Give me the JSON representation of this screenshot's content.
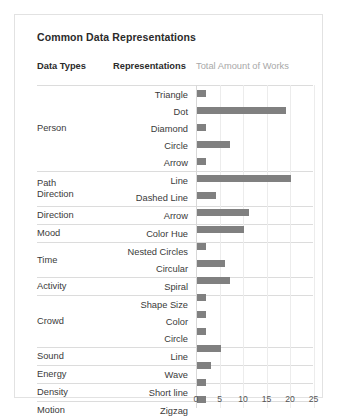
{
  "chart_title": "Common Data Representations",
  "headers": {
    "data_types": "Data Types",
    "representations": "Representations",
    "value_axis": "Total Amount of Works"
  },
  "chart_data": {
    "type": "bar",
    "orientation": "horizontal",
    "title": "Common Data Representations",
    "xlabel": "Total Amount of Works",
    "ylabel": "Representations",
    "xlim": [
      0,
      27
    ],
    "xticks": [
      0,
      5,
      10,
      15,
      20,
      25
    ],
    "xtick_labels": [
      "0",
      "5",
      "10",
      "15",
      "20",
      "25"
    ],
    "grid": "vertical",
    "legend": "none",
    "bar_color": "#808080",
    "categories": [
      "Triangle",
      "Dot",
      "Diamond",
      "Circle",
      "Arrow",
      "Line",
      "Dashed Line",
      "Arrow",
      "Color Hue",
      "Nested Circles",
      "Circular",
      "Spiral",
      "Shape Size",
      "Color",
      "Circle",
      "Line",
      "Wave",
      "Short line",
      "Zigzag"
    ],
    "values": [
      2,
      19,
      2,
      7,
      2,
      20,
      4,
      11,
      10,
      2,
      6,
      7,
      2,
      2,
      2,
      5,
      3,
      2,
      2
    ],
    "groups": [
      "Person",
      "Person",
      "Person",
      "Person",
      "Person",
      "Path Direction",
      "Path Direction",
      "Direction",
      "Mood",
      "Time",
      "Time",
      "Activity",
      "Crowd",
      "Crowd",
      "Crowd",
      "Sound",
      "Energy",
      "Density",
      "Motion"
    ]
  },
  "rows": [
    {
      "type": "Person",
      "type_line2": "",
      "rep": "Triangle",
      "value": 2,
      "sep": true,
      "group_rows": 5
    },
    {
      "type": "",
      "type_line2": "",
      "rep": "Dot",
      "value": 19,
      "sep": false,
      "group_rows": 0
    },
    {
      "type": "",
      "type_line2": "",
      "rep": "Diamond",
      "value": 2,
      "sep": false,
      "group_rows": 0
    },
    {
      "type": "",
      "type_line2": "",
      "rep": "Circle",
      "value": 7,
      "sep": false,
      "group_rows": 0
    },
    {
      "type": "",
      "type_line2": "",
      "rep": "Arrow",
      "value": 2,
      "sep": false,
      "group_rows": 0
    },
    {
      "type": "Path",
      "type_line2": "Direction",
      "rep": "Line",
      "value": 20,
      "sep": true,
      "group_rows": 2
    },
    {
      "type": "",
      "type_line2": "",
      "rep": "Dashed Line",
      "value": 4,
      "sep": false,
      "group_rows": 0
    },
    {
      "type": "Direction",
      "type_line2": "",
      "rep": "Arrow",
      "value": 11,
      "sep": true,
      "group_rows": 1
    },
    {
      "type": "Mood",
      "type_line2": "",
      "rep": "Color Hue",
      "value": 10,
      "sep": true,
      "group_rows": 1
    },
    {
      "type": "Time",
      "type_line2": "",
      "rep": "Nested Circles",
      "value": 2,
      "sep": true,
      "group_rows": 2
    },
    {
      "type": "",
      "type_line2": "",
      "rep": "Circular",
      "value": 6,
      "sep": false,
      "group_rows": 0
    },
    {
      "type": "Activity",
      "type_line2": "",
      "rep": "Spiral",
      "value": 7,
      "sep": true,
      "group_rows": 1
    },
    {
      "type": "Crowd",
      "type_line2": "",
      "rep": "Shape Size",
      "value": 2,
      "sep": true,
      "group_rows": 3
    },
    {
      "type": "",
      "type_line2": "",
      "rep": "Color",
      "value": 2,
      "sep": false,
      "group_rows": 0
    },
    {
      "type": "",
      "type_line2": "",
      "rep": "Circle",
      "value": 2,
      "sep": false,
      "group_rows": 0
    },
    {
      "type": "Sound",
      "type_line2": "",
      "rep": "Line",
      "value": 5,
      "sep": true,
      "group_rows": 1
    },
    {
      "type": "Energy",
      "type_line2": "",
      "rep": "Wave",
      "value": 3,
      "sep": true,
      "group_rows": 1
    },
    {
      "type": "Density",
      "type_line2": "",
      "rep": "Short line",
      "value": 2,
      "sep": true,
      "group_rows": 1
    },
    {
      "type": "Motion",
      "type_line2": "",
      "rep": "Zigzag",
      "value": 2,
      "sep": true,
      "group_rows": 1
    }
  ]
}
